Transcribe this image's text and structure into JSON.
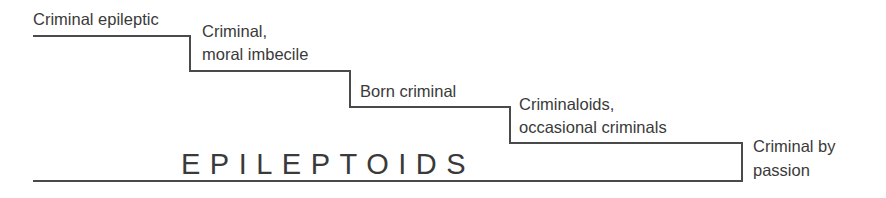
{
  "diagram": {
    "title": "EPILEPTOIDS",
    "steps": [
      {
        "label_line1": "Criminal epileptic",
        "label_line2": ""
      },
      {
        "label_line1": "Criminal,",
        "label_line2": "moral imbecile"
      },
      {
        "label_line1": "Born criminal",
        "label_line2": ""
      },
      {
        "label_line1": "Criminaloids,",
        "label_line2": "occasional criminals"
      },
      {
        "label_line1": "Criminal by",
        "label_line2": "passion"
      }
    ],
    "colors": {
      "line": "#4a4a4a",
      "text": "#3a3a3a",
      "background": "#ffffff"
    }
  }
}
